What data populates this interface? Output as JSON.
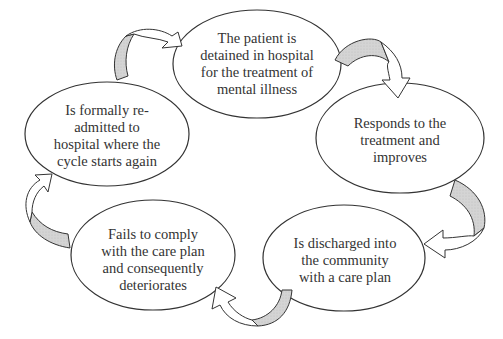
{
  "diagram": {
    "type": "cycle",
    "nodes": [
      {
        "id": "detained",
        "lines": [
          "The patient is",
          "detained in hospital",
          "for the treatment of",
          "mental illness"
        ]
      },
      {
        "id": "responds",
        "lines": [
          "Responds to the",
          "treatment and",
          "improves"
        ]
      },
      {
        "id": "discharged",
        "lines": [
          "Is discharged into",
          "the community",
          "with a care plan"
        ]
      },
      {
        "id": "fails",
        "lines": [
          "Fails to comply",
          "with the care plan",
          "and consequently",
          "deteriorates"
        ]
      },
      {
        "id": "readmitted",
        "lines": [
          "Is formally re-",
          "admitted to",
          "hospital where the",
          "cycle starts again"
        ]
      }
    ],
    "edges": [
      {
        "from": "detained",
        "to": "responds"
      },
      {
        "from": "responds",
        "to": "discharged"
      },
      {
        "from": "discharged",
        "to": "fails"
      },
      {
        "from": "fails",
        "to": "readmitted"
      },
      {
        "from": "readmitted",
        "to": "detained"
      }
    ],
    "colors": {
      "stroke": "#333333",
      "arrow_fill": "#d0d0d0",
      "background": "#ffffff"
    }
  }
}
